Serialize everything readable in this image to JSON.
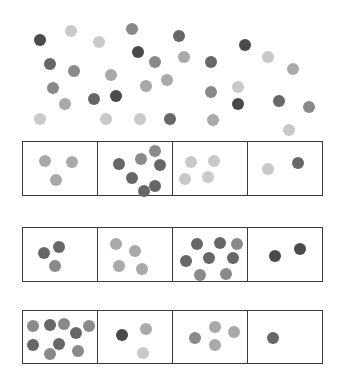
{
  "colors": {
    "dark": "#4a4a4a",
    "middark": "#676767",
    "mid": "#8a8a8a",
    "lightmid": "#a9a9a9",
    "light": "#c9c9c9",
    "border": "#3a3a3a"
  },
  "scatter": [
    {
      "x": 40,
      "y": 40,
      "shade": "dark"
    },
    {
      "x": 71,
      "y": 31,
      "shade": "light"
    },
    {
      "x": 99,
      "y": 42,
      "shade": "light"
    },
    {
      "x": 132,
      "y": 29,
      "shade": "mid"
    },
    {
      "x": 179,
      "y": 36,
      "shade": "middark"
    },
    {
      "x": 138,
      "y": 52,
      "shade": "dark"
    },
    {
      "x": 155,
      "y": 62,
      "shade": "mid"
    },
    {
      "x": 184,
      "y": 57,
      "shade": "lightmid"
    },
    {
      "x": 211,
      "y": 62,
      "shade": "middark"
    },
    {
      "x": 245,
      "y": 45,
      "shade": "dark"
    },
    {
      "x": 268,
      "y": 57,
      "shade": "light"
    },
    {
      "x": 293,
      "y": 69,
      "shade": "lightmid"
    },
    {
      "x": 50,
      "y": 64,
      "shade": "middark"
    },
    {
      "x": 74,
      "y": 71,
      "shade": "mid"
    },
    {
      "x": 111,
      "y": 75,
      "shade": "lightmid"
    },
    {
      "x": 146,
      "y": 86,
      "shade": "lightmid"
    },
    {
      "x": 167,
      "y": 80,
      "shade": "lightmid"
    },
    {
      "x": 53,
      "y": 88,
      "shade": "mid"
    },
    {
      "x": 65,
      "y": 104,
      "shade": "lightmid"
    },
    {
      "x": 94,
      "y": 99,
      "shade": "middark"
    },
    {
      "x": 116,
      "y": 96,
      "shade": "dark"
    },
    {
      "x": 211,
      "y": 92,
      "shade": "mid"
    },
    {
      "x": 238,
      "y": 87,
      "shade": "light"
    },
    {
      "x": 238,
      "y": 104,
      "shade": "dark"
    },
    {
      "x": 279,
      "y": 101,
      "shade": "middark"
    },
    {
      "x": 309,
      "y": 107,
      "shade": "mid"
    },
    {
      "x": 40,
      "y": 119,
      "shade": "light"
    },
    {
      "x": 106,
      "y": 119,
      "shade": "light"
    },
    {
      "x": 140,
      "y": 119,
      "shade": "light"
    },
    {
      "x": 170,
      "y": 119,
      "shade": "middark"
    },
    {
      "x": 213,
      "y": 120,
      "shade": "lightmid"
    },
    {
      "x": 289,
      "y": 130,
      "shade": "light"
    }
  ],
  "rows": [
    {
      "top": 141,
      "height": 55,
      "cells": [
        {
          "count": 3,
          "dots": [
            {
              "x": 22,
              "y": 19,
              "shade": "lightmid"
            },
            {
              "x": 49,
              "y": 20,
              "shade": "lightmid"
            },
            {
              "x": 33,
              "y": 38,
              "shade": "lightmid"
            }
          ]
        },
        {
          "count": 7,
          "dots": [
            {
              "x": 21,
              "y": 22,
              "shade": "middark"
            },
            {
              "x": 43,
              "y": 17,
              "shade": "mid"
            },
            {
              "x": 57,
              "y": 9,
              "shade": "mid"
            },
            {
              "x": 62,
              "y": 23,
              "shade": "middark"
            },
            {
              "x": 34,
              "y": 36,
              "shade": "middark"
            },
            {
              "x": 57,
              "y": 44,
              "shade": "middark"
            },
            {
              "x": 46,
              "y": 49,
              "shade": "middark"
            }
          ]
        },
        {
          "count": 4,
          "dots": [
            {
              "x": 18,
              "y": 20,
              "shade": "light"
            },
            {
              "x": 41,
              "y": 19,
              "shade": "light"
            },
            {
              "x": 12,
              "y": 37,
              "shade": "light"
            },
            {
              "x": 35,
              "y": 35,
              "shade": "light"
            }
          ]
        },
        {
          "count": 2,
          "dots": [
            {
              "x": 20,
              "y": 27,
              "shade": "light"
            },
            {
              "x": 50,
              "y": 21,
              "shade": "middark"
            }
          ]
        }
      ]
    },
    {
      "top": 227,
      "height": 55,
      "cells": [
        {
          "count": 3,
          "dots": [
            {
              "x": 21,
              "y": 25,
              "shade": "middark"
            },
            {
              "x": 36,
              "y": 19,
              "shade": "middark"
            },
            {
              "x": 32,
              "y": 38,
              "shade": "mid"
            }
          ]
        },
        {
          "count": 4,
          "dots": [
            {
              "x": 18,
              "y": 16,
              "shade": "lightmid"
            },
            {
              "x": 37,
              "y": 23,
              "shade": "lightmid"
            },
            {
              "x": 21,
              "y": 38,
              "shade": "lightmid"
            },
            {
              "x": 44,
              "y": 41,
              "shade": "lightmid"
            }
          ]
        },
        {
          "count": 9,
          "dots": [
            {
              "x": 24,
              "y": 16,
              "shade": "middark"
            },
            {
              "x": 47,
              "y": 15,
              "shade": "middark"
            },
            {
              "x": 64,
              "y": 16,
              "shade": "mid"
            },
            {
              "x": 13,
              "y": 33,
              "shade": "middark"
            },
            {
              "x": 36,
              "y": 30,
              "shade": "middark"
            },
            {
              "x": 60,
              "y": 30,
              "shade": "middark"
            },
            {
              "x": 27,
              "y": 47,
              "shade": "mid"
            },
            {
              "x": 53,
              "y": 46,
              "shade": "mid"
            }
          ]
        },
        {
          "count": 2,
          "dots": [
            {
              "x": 27,
              "y": 28,
              "shade": "dark"
            },
            {
              "x": 52,
              "y": 21,
              "shade": "dark"
            }
          ]
        }
      ]
    },
    {
      "top": 310,
      "height": 54,
      "cells": [
        {
          "count": 9,
          "dots": [
            {
              "x": 10,
              "y": 15,
              "shade": "mid"
            },
            {
              "x": 27,
              "y": 14,
              "shade": "middark"
            },
            {
              "x": 41,
              "y": 13,
              "shade": "mid"
            },
            {
              "x": 53,
              "y": 22,
              "shade": "middark"
            },
            {
              "x": 66,
              "y": 15,
              "shade": "mid"
            },
            {
              "x": 10,
              "y": 34,
              "shade": "middark"
            },
            {
              "x": 36,
              "y": 33,
              "shade": "middark"
            },
            {
              "x": 27,
              "y": 43,
              "shade": "mid"
            },
            {
              "x": 55,
              "y": 40,
              "shade": "mid"
            }
          ]
        },
        {
          "count": 3,
          "dots": [
            {
              "x": 24,
              "y": 24,
              "shade": "dark"
            },
            {
              "x": 48,
              "y": 18,
              "shade": "lightmid"
            },
            {
              "x": 45,
              "y": 42,
              "shade": "light"
            }
          ]
        },
        {
          "count": 4,
          "dots": [
            {
              "x": 22,
              "y": 27,
              "shade": "mid"
            },
            {
              "x": 42,
              "y": 16,
              "shade": "lightmid"
            },
            {
              "x": 61,
              "y": 21,
              "shade": "lightmid"
            },
            {
              "x": 42,
              "y": 34,
              "shade": "lightmid"
            }
          ]
        },
        {
          "count": 1,
          "dots": [
            {
              "x": 25,
              "y": 27,
              "shade": "middark"
            }
          ]
        }
      ]
    }
  ]
}
